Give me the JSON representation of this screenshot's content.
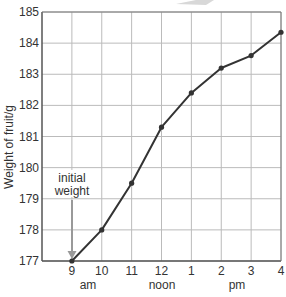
{
  "chart_data": {
    "type": "line",
    "title": "",
    "xlabel": "",
    "ylabel": "Weight of fruit/g",
    "categories": [
      "9",
      "10",
      "11",
      "12",
      "1",
      "2",
      "3",
      "4"
    ],
    "x_group_labels": [
      {
        "label": "am",
        "center_between": [
          "9",
          "10"
        ]
      },
      {
        "label": "noon",
        "at": "12"
      },
      {
        "label": "pm",
        "center_between": [
          "2",
          "3"
        ]
      }
    ],
    "series": [
      {
        "name": "Weight of fruit",
        "values": [
          177.0,
          178.0,
          179.5,
          181.3,
          182.4,
          183.2,
          183.6,
          184.35
        ]
      }
    ],
    "ylim": [
      177,
      185
    ],
    "yticks": [
      177,
      178,
      179,
      180,
      181,
      182,
      183,
      184,
      185
    ],
    "grid": true,
    "legend": "none",
    "annotations": [
      {
        "text": "initial weight",
        "points_to": {
          "x": "9",
          "y": 177
        }
      }
    ]
  },
  "labels": {
    "ylabel": "Weight of fruit/g",
    "annotation_line1": "initial",
    "annotation_line2": "weight",
    "am": "am",
    "noon": "noon",
    "pm": "pm"
  },
  "colors": {
    "line": "#333333",
    "grid": "#bbbbbb",
    "arrow": "#999999"
  }
}
